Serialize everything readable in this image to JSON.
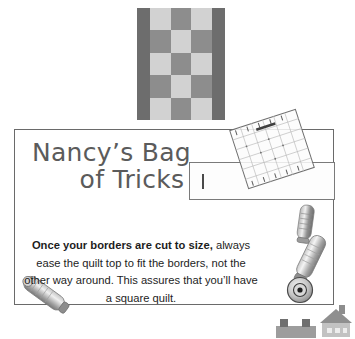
{
  "page": {
    "background_color": "#ffffff",
    "width": 355,
    "height": 339
  },
  "quilt_block": {
    "name": "checkerboard-quilt-block",
    "rows": 5,
    "columns": 3,
    "border_color": "#6d6d6d",
    "light_color": "#d2d2d2",
    "mid_color": "#8d8d8d",
    "cells": [
      "light",
      "mid",
      "light",
      "mid",
      "light",
      "mid",
      "light",
      "mid",
      "light",
      "mid",
      "light",
      "mid",
      "light",
      "mid",
      "light"
    ]
  },
  "tip_box": {
    "border_color": "#6a6a6a",
    "title_color": "#5b5b5b",
    "title": {
      "line1": "Nancy’s Bag",
      "line2": "of Tricks"
    },
    "body": {
      "lede": "Once your borders are cut to size,",
      "rest": " always ease the quilt top to fit the borders, not the other way around. This assures that you’ll have a square quilt."
    }
  },
  "decorations": [
    {
      "name": "quilting-ruler-icon",
      "label": "quilting ruler"
    },
    {
      "name": "fabric-strip-icon",
      "label": "fabric strip"
    },
    {
      "name": "rotary-cutter-icon",
      "label": "rotary cutter"
    },
    {
      "name": "house-icon",
      "label": "house"
    }
  ]
}
